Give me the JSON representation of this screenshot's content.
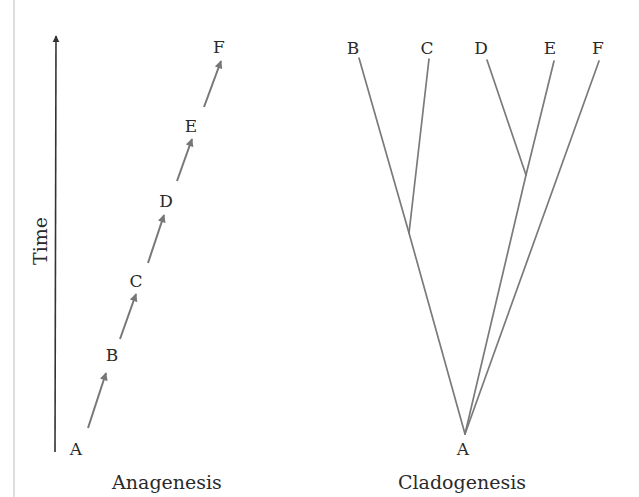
{
  "figure": {
    "colors": {
      "background": "#ffffff",
      "text": "#2a2a2a",
      "branch": "#7a7a7a",
      "step_arrow": "#777777",
      "time_axis": "#333333",
      "edge_rule": "#c8c8c8"
    },
    "time_axis": {
      "label": "Time",
      "direction": "up"
    },
    "anagenesis": {
      "caption": "Anagenesis",
      "nodes": [
        {
          "id": "A",
          "label": "A"
        },
        {
          "id": "B",
          "label": "B"
        },
        {
          "id": "C",
          "label": "C"
        },
        {
          "id": "D",
          "label": "D"
        },
        {
          "id": "E",
          "label": "E"
        },
        {
          "id": "F",
          "label": "F"
        }
      ],
      "transitions": [
        {
          "from": "A",
          "to": "B"
        },
        {
          "from": "B",
          "to": "C"
        },
        {
          "from": "C",
          "to": "D"
        },
        {
          "from": "D",
          "to": "E"
        },
        {
          "from": "E",
          "to": "F"
        }
      ]
    },
    "cladogenesis": {
      "caption": "Cladogenesis",
      "root": {
        "id": "A",
        "label": "A"
      },
      "tips": [
        {
          "id": "B",
          "label": "B"
        },
        {
          "id": "C",
          "label": "C"
        },
        {
          "id": "D",
          "label": "D"
        },
        {
          "id": "E",
          "label": "E"
        },
        {
          "id": "F",
          "label": "F"
        }
      ],
      "clades": [
        {
          "members": [
            "B",
            "C"
          ]
        },
        {
          "members": [
            "D",
            "E"
          ]
        },
        {
          "members": [
            "F"
          ]
        }
      ]
    }
  }
}
